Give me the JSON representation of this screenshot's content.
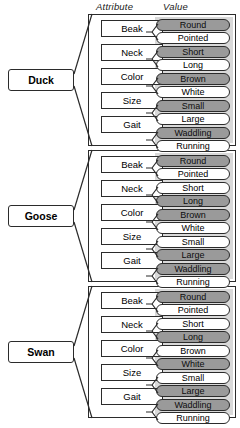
{
  "figure": {
    "headers": {
      "attribute": "Attribute",
      "value": "Value"
    },
    "attribute_names": [
      "Beak",
      "Neck",
      "Color",
      "Size",
      "Gait"
    ],
    "colors": {
      "selected_fill": "#9a9a9a",
      "unselected_fill": "#ffffff",
      "panel_background": "#d9d9d9",
      "outline": "#2b2b2b"
    },
    "panels": [
      {
        "class_label": "Duck",
        "rows": [
          {
            "attribute": "Beak",
            "values": [
              {
                "label": "Round",
                "selected": true
              },
              {
                "label": "Pointed",
                "selected": false
              }
            ]
          },
          {
            "attribute": "Neck",
            "values": [
              {
                "label": "Short",
                "selected": true
              },
              {
                "label": "Long",
                "selected": false
              }
            ]
          },
          {
            "attribute": "Color",
            "values": [
              {
                "label": "Brown",
                "selected": true
              },
              {
                "label": "White",
                "selected": false
              }
            ]
          },
          {
            "attribute": "Size",
            "values": [
              {
                "label": "Small",
                "selected": true
              },
              {
                "label": "Large",
                "selected": false
              }
            ]
          },
          {
            "attribute": "Gait",
            "values": [
              {
                "label": "Waddling",
                "selected": true
              },
              {
                "label": "Running",
                "selected": false
              }
            ]
          }
        ]
      },
      {
        "class_label": "Goose",
        "rows": [
          {
            "attribute": "Beak",
            "values": [
              {
                "label": "Round",
                "selected": true
              },
              {
                "label": "Pointed",
                "selected": false
              }
            ]
          },
          {
            "attribute": "Neck",
            "values": [
              {
                "label": "Short",
                "selected": false
              },
              {
                "label": "Long",
                "selected": true
              }
            ]
          },
          {
            "attribute": "Color",
            "values": [
              {
                "label": "Brown",
                "selected": true
              },
              {
                "label": "White",
                "selected": false
              }
            ]
          },
          {
            "attribute": "Size",
            "values": [
              {
                "label": "Small",
                "selected": false
              },
              {
                "label": "Large",
                "selected": true
              }
            ]
          },
          {
            "attribute": "Gait",
            "values": [
              {
                "label": "Waddling",
                "selected": true
              },
              {
                "label": "Running",
                "selected": false
              }
            ]
          }
        ]
      },
      {
        "class_label": "Swan",
        "rows": [
          {
            "attribute": "Beak",
            "values": [
              {
                "label": "Round",
                "selected": true
              },
              {
                "label": "Pointed",
                "selected": false
              }
            ]
          },
          {
            "attribute": "Neck",
            "values": [
              {
                "label": "Short",
                "selected": false
              },
              {
                "label": "Long",
                "selected": true
              }
            ]
          },
          {
            "attribute": "Color",
            "values": [
              {
                "label": "Brown",
                "selected": false
              },
              {
                "label": "White",
                "selected": true
              }
            ]
          },
          {
            "attribute": "Size",
            "values": [
              {
                "label": "Small",
                "selected": false
              },
              {
                "label": "Large",
                "selected": true
              }
            ]
          },
          {
            "attribute": "Gait",
            "values": [
              {
                "label": "Waddling",
                "selected": true
              },
              {
                "label": "Running",
                "selected": false
              }
            ]
          }
        ]
      }
    ]
  }
}
